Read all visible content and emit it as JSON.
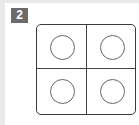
{
  "badge": {
    "label": "2",
    "background": "#6b6b6b",
    "color": "#ffffff"
  },
  "grid": {
    "rows": 2,
    "columns": 2,
    "border_color": "#3a3a3a",
    "cells": [
      {
        "row": 1,
        "col": 1,
        "shape": "circle-outline"
      },
      {
        "row": 1,
        "col": 2,
        "shape": "circle-outline"
      },
      {
        "row": 2,
        "col": 1,
        "shape": "circle-outline"
      },
      {
        "row": 2,
        "col": 2,
        "shape": "circle-outline"
      }
    ],
    "circle_stroke": "#666666"
  }
}
